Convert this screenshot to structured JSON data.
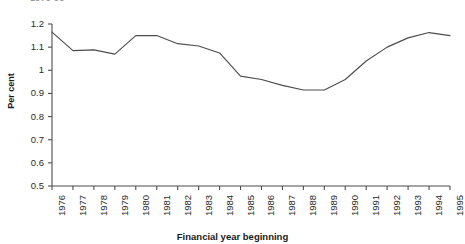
{
  "figure": {
    "title_fragment": "1976-95",
    "width": 465,
    "height": 244
  },
  "chart_data": {
    "type": "line",
    "title": "1976-95",
    "xlabel": "Financial year beginning",
    "ylabel": "Per cent",
    "categories": [
      "1976",
      "1977",
      "1978",
      "1979",
      "1980",
      "1981",
      "1982",
      "1983",
      "1984",
      "1985",
      "1986",
      "1987",
      "1988",
      "1989",
      "1990",
      "1991",
      "1992",
      "1993",
      "1994",
      "1995"
    ],
    "values": [
      1.165,
      1.085,
      1.088,
      1.07,
      1.15,
      1.15,
      1.115,
      1.105,
      1.075,
      0.975,
      0.96,
      0.935,
      0.915,
      0.915,
      0.96,
      1.04,
      1.1,
      1.14,
      1.163,
      1.15
    ],
    "series": [
      {
        "name": "Per cent",
        "values": [
          1.165,
          1.085,
          1.088,
          1.07,
          1.15,
          1.15,
          1.115,
          1.105,
          1.075,
          0.975,
          0.96,
          0.935,
          0.915,
          0.915,
          0.96,
          1.04,
          1.1,
          1.14,
          1.163,
          1.15
        ],
        "color": "#4d4d4d"
      }
    ],
    "ylim": [
      0.5,
      1.2
    ],
    "yticks": [
      "0.5",
      "0.6",
      "0.7",
      "0.8",
      "0.9",
      "1",
      "1.1",
      "1.2"
    ],
    "ytick_values": [
      0.5,
      0.6,
      0.7,
      0.8,
      0.9,
      1.0,
      1.1,
      1.2
    ],
    "xlim": [
      "1976",
      "1995"
    ],
    "grid": false,
    "legend": "none",
    "markers": "none",
    "line_color": "#4d4d4d",
    "axis_color": "#4d4d4d"
  },
  "geometry": {
    "plot_left": 52,
    "plot_right": 450,
    "plot_top": 24,
    "plot_bottom": 186
  }
}
